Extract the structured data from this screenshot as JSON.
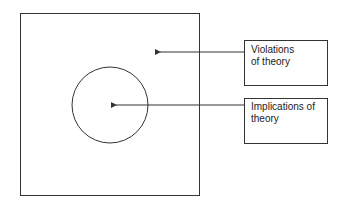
{
  "diagram": {
    "outer_region": {
      "name": "theory-space"
    },
    "inner_region": {
      "name": "implications-circle"
    },
    "labels": [
      {
        "text": "Violations of theory",
        "line1": "Violations",
        "line2": "of theory"
      },
      {
        "text": "Implications of theory",
        "line1": "Implications of",
        "line2": "theory"
      }
    ],
    "colors": {
      "stroke": "#333333",
      "background": "#ffffff"
    }
  }
}
